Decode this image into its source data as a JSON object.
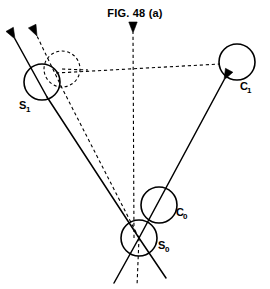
{
  "figure": {
    "title": "FIG. 48 (a)",
    "type": "technical-line-diagram",
    "width": 270,
    "height": 289,
    "background_color": "#ffffff",
    "stroke_color": "#000000"
  },
  "nodes": [
    {
      "id": "S1",
      "label": "S",
      "subscript": "1",
      "style": "solid",
      "cx": 42,
      "cy": 82,
      "r": 18,
      "label_x": 19,
      "label_y": 109
    },
    {
      "id": "S1_ghost",
      "label": "",
      "subscript": "",
      "style": "dashed",
      "cx": 62,
      "cy": 69,
      "r": 18,
      "label_x": 0,
      "label_y": 0
    },
    {
      "id": "C1",
      "label": "C",
      "subscript": "1",
      "style": "solid",
      "cx": 237,
      "cy": 62,
      "r": 18,
      "label_x": 240,
      "label_y": 90
    },
    {
      "id": "C0",
      "label": "C",
      "subscript": "0",
      "style": "solid",
      "cx": 159,
      "cy": 205,
      "r": 18,
      "label_x": 176,
      "label_y": 216
    },
    {
      "id": "S0",
      "label": "S",
      "subscript": "0",
      "style": "solid",
      "cx": 139,
      "cy": 238,
      "r": 18,
      "label_x": 158,
      "label_y": 249
    }
  ],
  "edges": [
    {
      "name": "s0-to-s1-solid",
      "style": "solid",
      "arrow": false,
      "x1": 139,
      "y1": 238,
      "x2": 47,
      "y2": 97
    },
    {
      "name": "s0-to-s1-dashed",
      "style": "dashed",
      "arrow": false,
      "x1": 139,
      "y1": 238,
      "x2": 62,
      "y2": 88
    },
    {
      "name": "s0-to-c1-solid-arrow",
      "style": "solid",
      "arrow": true,
      "x1": 139,
      "y1": 238,
      "x2": 224,
      "y2": 80
    },
    {
      "name": "s1-to-c1-dashed-baseline",
      "style": "dashed",
      "arrow": false,
      "x1": 56,
      "y1": 73,
      "x2": 220,
      "y2": 64
    },
    {
      "name": "central-vertical-dashed-arrow",
      "style": "dashed",
      "arrow": true,
      "x1": 134,
      "y1": 238,
      "x2": 133,
      "y2": 33
    },
    {
      "name": "s0-lower-dashed-axis",
      "style": "dashed",
      "arrow": false,
      "x1": 139,
      "y1": 238,
      "x2": 137,
      "y2": 286
    },
    {
      "name": "s0-lower-left-leg",
      "style": "solid",
      "arrow": false,
      "x1": 139,
      "y1": 238,
      "x2": 114,
      "y2": 283
    },
    {
      "name": "s0-lower-right-leg",
      "style": "solid",
      "arrow": false,
      "x1": 139,
      "y1": 238,
      "x2": 166,
      "y2": 278
    },
    {
      "name": "s1-velocity-solid-arrow",
      "style": "solid",
      "arrow": true,
      "x1": 47,
      "y1": 97,
      "x2": 15,
      "y2": 39
    },
    {
      "name": "s1-velocity-dashed-arrow",
      "style": "dashed",
      "arrow": true,
      "x1": 62,
      "y1": 88,
      "x2": 37,
      "y2": 36
    },
    {
      "name": "ghost-circle-radius-dashed",
      "style": "dashed",
      "arrow": false,
      "x1": 62,
      "y1": 69,
      "x2": 88,
      "y2": 70
    }
  ],
  "arrowheads": [
    {
      "name": "arrowhead-s1-solid",
      "x": 15,
      "y": 39,
      "angle": 241
    },
    {
      "name": "arrowhead-s1-dashed",
      "x": 37,
      "y": 36,
      "angle": 244
    },
    {
      "name": "arrowhead-central-dashed",
      "x": 133,
      "y": 33,
      "angle": 270
    },
    {
      "name": "arrowhead-c1-solid",
      "x": 224,
      "y": 80,
      "angle": 298
    }
  ]
}
